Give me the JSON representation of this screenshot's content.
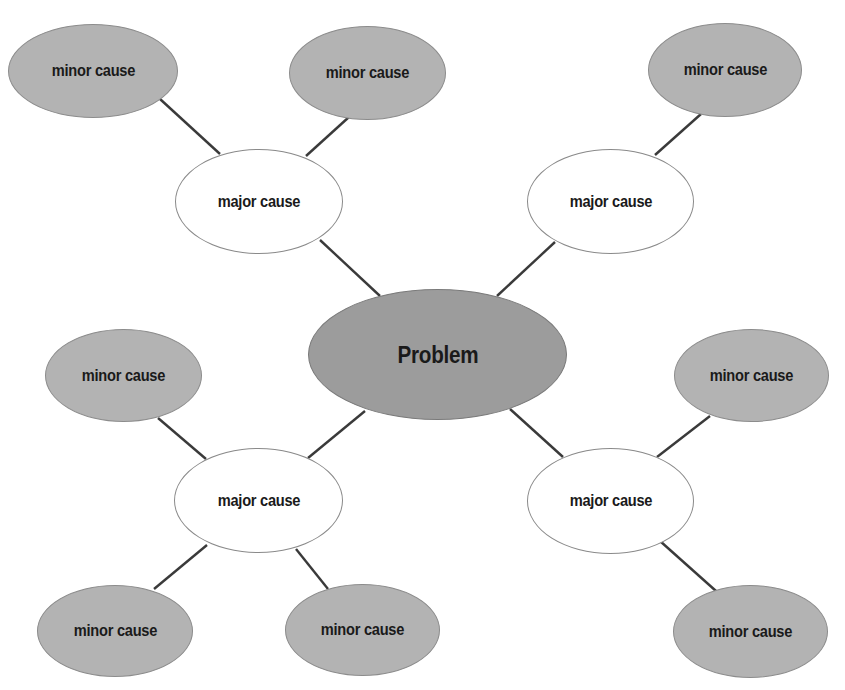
{
  "diagram": {
    "type": "cause-map",
    "colors": {
      "background": "#ffffff",
      "problem_fill": "#9c9c9c",
      "minor_fill": "#b3b3b3",
      "major_fill": "#ffffff",
      "connector": "#3a3a3a"
    },
    "problem": {
      "label": "Problem"
    },
    "major_causes": [
      {
        "label": "major cause",
        "position": "top-left"
      },
      {
        "label": "major cause",
        "position": "top-right"
      },
      {
        "label": "major cause",
        "position": "bottom-left"
      },
      {
        "label": "major cause",
        "position": "bottom-right"
      }
    ],
    "minor_causes": [
      {
        "label": "minor cause",
        "parent": "top-left",
        "position": "top-left-1"
      },
      {
        "label": "minor cause",
        "parent": "top-left",
        "position": "top-left-2"
      },
      {
        "label": "minor cause",
        "parent": "top-right",
        "position": "top-right-1"
      },
      {
        "label": "minor cause",
        "parent": "bottom-left",
        "position": "bottom-left-upper"
      },
      {
        "label": "minor cause",
        "parent": "bottom-left",
        "position": "bottom-left-lower-1"
      },
      {
        "label": "minor cause",
        "parent": "bottom-left",
        "position": "bottom-left-lower-2"
      },
      {
        "label": "minor cause",
        "parent": "bottom-right",
        "position": "bottom-right-upper"
      },
      {
        "label": "minor cause",
        "parent": "bottom-right",
        "position": "bottom-right-lower"
      }
    ]
  }
}
